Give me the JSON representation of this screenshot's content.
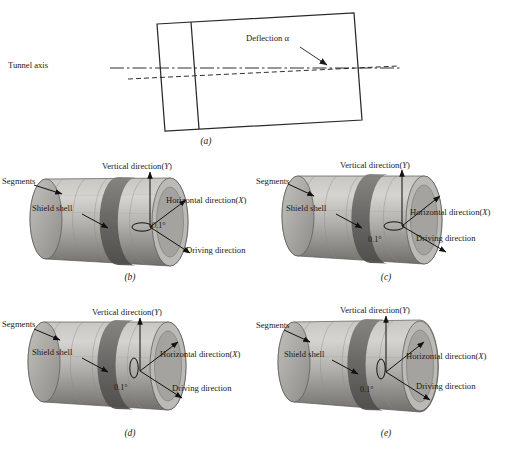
{
  "figure": {
    "background": "#ffffff",
    "panel_a": {
      "label": "(a)",
      "tunnel_axis_label": "Tunnel axis",
      "deflection_label": "Deflection α"
    },
    "panels": [
      {
        "id": "b",
        "label": "(b)",
        "segments_label": "Segments",
        "shield_shell_label": "Shield shell",
        "vertical_label": "Vertical direction(",
        "vertical_axis": "Y",
        "vertical_label_end": ")",
        "horizontal_label": "Horizontal direction(",
        "horizontal_axis": "X",
        "horizontal_label_end": ")",
        "driving_label": "Driving direction",
        "angle_label": "0.1°",
        "ellipse_orientation": "horizontal"
      },
      {
        "id": "c",
        "label": "(c)",
        "segments_label": "Segments",
        "shield_shell_label": "Shield shell",
        "vertical_label": "Vertical direction(",
        "vertical_axis": "Y",
        "vertical_label_end": ")",
        "horizontal_label": "Horizontal direction(",
        "horizontal_axis": "X",
        "horizontal_label_end": ")",
        "driving_label": "Driving direction",
        "angle_label": "0.1°",
        "ellipse_orientation": "horizontal"
      },
      {
        "id": "d",
        "label": "(d)",
        "segments_label": "Segments",
        "shield_shell_label": "Shield shell",
        "vertical_label": "Vertical direction(",
        "vertical_axis": "Y",
        "vertical_label_end": ")",
        "horizontal_label": "Horizontal direction(",
        "horizontal_axis": "X",
        "horizontal_label_end": ")",
        "driving_label": "Driving direction",
        "angle_label": "0.1°",
        "ellipse_orientation": "vertical"
      },
      {
        "id": "e",
        "label": "(e)",
        "segments_label": "Segments",
        "shield_shell_label": "Shield shell",
        "vertical_label": "Vertical direction(",
        "vertical_axis": "Y",
        "vertical_label_end": ")",
        "horizontal_label": "Horizontal direction(",
        "horizontal_axis": "X",
        "horizontal_label_end": ")",
        "driving_label": "Driving direction",
        "angle_label": "0.1°",
        "ellipse_orientation": "vertical"
      }
    ],
    "colors": {
      "line": "#1a1a1a",
      "cylinder_light": "#cfcdc9",
      "cylinder_mid": "#a8a6a2",
      "cylinder_dark": "#6f6d69",
      "shield_band": "#5e5c58",
      "endcap": "#b9b7b3"
    }
  }
}
